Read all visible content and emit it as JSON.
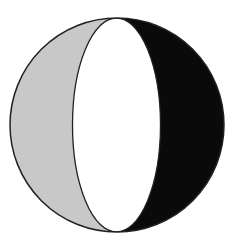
{
  "diagram": {
    "sphere": {
      "cx": 117,
      "cy": 125,
      "r": 107,
      "stroke": "#222222"
    },
    "lens": {
      "cx": 116.5,
      "cy": 125,
      "rx": 44,
      "ry": 107
    },
    "regions": [
      {
        "name": "left-crescent",
        "fill": "#c8c8c8"
      },
      {
        "name": "center-lens",
        "fill": "#ffffff"
      },
      {
        "name": "right-crescent",
        "fill": "#0a0a0a"
      }
    ]
  }
}
